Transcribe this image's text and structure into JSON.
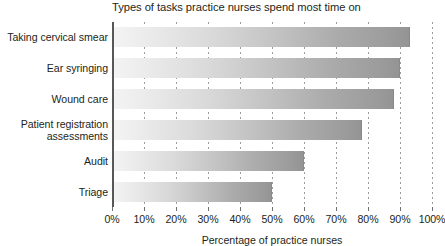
{
  "chart_data": {
    "type": "bar",
    "orientation": "horizontal",
    "title": "Types of tasks practice nurses spend most time on",
    "xlabel": "Percentage of practice nurses",
    "ylabel": "",
    "categories": [
      "Taking cervical smear",
      "Ear syringing",
      "Wound care",
      "Patient registration assessments",
      "Audit",
      "Triage"
    ],
    "values": [
      93,
      90,
      88,
      78,
      60,
      50
    ],
    "xlim": [
      0,
      100
    ],
    "xticks": [
      0,
      10,
      20,
      30,
      40,
      50,
      60,
      70,
      80,
      90,
      100
    ],
    "xtick_labels": [
      "0%",
      "10%",
      "20%",
      "30%",
      "40%",
      "50%",
      "60%",
      "70%",
      "80%",
      "90%",
      "100%"
    ],
    "grid": true,
    "grid_style": "dotted-vertical",
    "legend": null,
    "bar_fill": "gradient-light-gray-to-gray",
    "bar_color_start": "#f4f4f4",
    "bar_color_end": "#949494",
    "axis_color": "#58585b",
    "text_color": "#231f20"
  },
  "category_label_lines": [
    [
      "Taking cervical smear"
    ],
    [
      "Ear syringing"
    ],
    [
      "Wound care"
    ],
    [
      "Patient registration",
      "assessments"
    ],
    [
      "Audit"
    ],
    [
      "Triage"
    ]
  ]
}
